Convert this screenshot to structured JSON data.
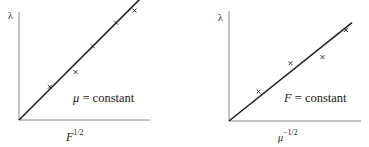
{
  "chart_data": [
    {
      "type": "scatter",
      "title": "",
      "xlabel": "F^{1/2}",
      "xlabel_base": "F",
      "xlabel_exp": "1/2",
      "ylabel": "λ",
      "annotation": "μ = constant",
      "annotation_symbol": "μ",
      "annotation_text": " = constant",
      "grid": false,
      "legend": "none",
      "fit_line": {
        "from": [
          0,
          0
        ],
        "to": [
          1.0,
          1.0
        ]
      },
      "points": [
        {
          "x": 0.25,
          "y": 0.27
        },
        {
          "x": 0.46,
          "y": 0.39
        },
        {
          "x": 0.6,
          "y": 0.6
        },
        {
          "x": 0.79,
          "y": 0.79
        },
        {
          "x": 0.94,
          "y": 0.89
        }
      ],
      "xlim": [
        0,
        1.1
      ],
      "ylim": [
        0,
        1.1
      ]
    },
    {
      "type": "scatter",
      "title": "",
      "xlabel": "μ^{-1/2}",
      "xlabel_base": "μ",
      "xlabel_exp": "−1/2",
      "ylabel": "λ",
      "annotation": "F = constant",
      "annotation_symbol": "F",
      "annotation_text": " = constant",
      "grid": false,
      "legend": "none",
      "fit_line": {
        "from": [
          0,
          0
        ],
        "to": [
          1.0,
          0.8
        ]
      },
      "points": [
        {
          "x": 0.24,
          "y": 0.24
        },
        {
          "x": 0.5,
          "y": 0.47
        },
        {
          "x": 0.76,
          "y": 0.52
        },
        {
          "x": 0.95,
          "y": 0.74
        }
      ],
      "xlim": [
        0,
        1.1
      ],
      "ylim": [
        0,
        1.1
      ]
    }
  ],
  "colors": {
    "ink": "#222222",
    "axis": "#888888",
    "background": "#ffffff"
  }
}
